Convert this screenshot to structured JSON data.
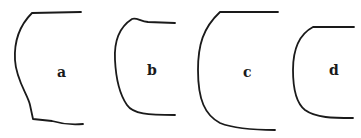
{
  "figure": {
    "background": "#ffffff",
    "stroke_color": "#1a1a1a",
    "profiles": [
      {
        "id": "a",
        "label": "a",
        "path": "M81,12 L32,13 C20,25 14,42 15,60 C16,80 28,95 30,105 L33,119 L52,121 C62,124 72,125 83,124",
        "label_x": 57,
        "label_y": 77
      },
      {
        "id": "b",
        "label": "b",
        "path": "M175,23 L148,22 C140,21 136,17 132,19 C118,28 114,42 115,60 C116,80 120,95 127,105 C133,114 148,115 175,115",
        "label_x": 147,
        "label_y": 75
      },
      {
        "id": "c",
        "label": "c",
        "path": "M278,12 L220,12 C203,28 198,45 198,70 C198,100 205,115 220,123 C235,129 255,130 275,130",
        "label_x": 243,
        "label_y": 77
      },
      {
        "id": "d",
        "label": "d",
        "path": "M354,27 L313,27 C298,35 293,50 293,70 C293,90 296,103 305,110 C316,118 333,118 353,118",
        "label_x": 329,
        "label_y": 75
      }
    ]
  }
}
